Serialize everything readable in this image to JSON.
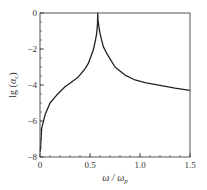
{
  "chart_data": {
    "type": "line",
    "title": "",
    "xlabel": "ω / ωp",
    "xlabel_parts": {
      "main": "ω / ω",
      "sub": "p"
    },
    "ylabel": "lg (αc)",
    "ylabel_parts": {
      "prefix": "lg (",
      "main": "α",
      "sub": "c",
      "suffix": ")"
    },
    "xlim": [
      0,
      1.5
    ],
    "ylim": [
      -8,
      0
    ],
    "xticks": [
      0,
      0.5,
      1.0,
      1.5
    ],
    "xtick_labels": [
      "0",
      "0.5",
      "1.0",
      "1.5"
    ],
    "yticks": [
      0,
      -2,
      -4,
      -6,
      -8
    ],
    "ytick_labels": [
      "0",
      "−2",
      "−4",
      "−6",
      "−8"
    ],
    "x_minor_step": 0.1,
    "y_minor_step": 0.5,
    "grid": false,
    "legend": null,
    "series": [
      {
        "name": "lg(αc)",
        "color": "#222222",
        "x": [
          0.003,
          0.017,
          0.05,
          0.1,
          0.167,
          0.25,
          0.3,
          0.383,
          0.45,
          0.483,
          0.533,
          0.555,
          0.567,
          0.575,
          0.577,
          0.58,
          0.59,
          0.6,
          0.633,
          0.667,
          0.75,
          0.85,
          0.95,
          1.05,
          1.2,
          1.35,
          1.5
        ],
        "y": [
          -7.7,
          -6.4,
          -5.67,
          -5.0,
          -4.56,
          -4.1,
          -3.9,
          -3.55,
          -3.1,
          -2.8,
          -2.06,
          -1.5,
          -1.13,
          -0.6,
          0.0,
          -0.39,
          -0.8,
          -1.13,
          -1.87,
          -2.24,
          -3.0,
          -3.45,
          -3.72,
          -3.87,
          -4.02,
          -4.17,
          -4.3
        ]
      }
    ],
    "annotations": []
  },
  "plot_area": {
    "left": 40,
    "top": 13,
    "right": 190,
    "bottom": 157
  },
  "colors": {
    "axis": "#555555",
    "line": "#222222",
    "text": "#333333"
  }
}
